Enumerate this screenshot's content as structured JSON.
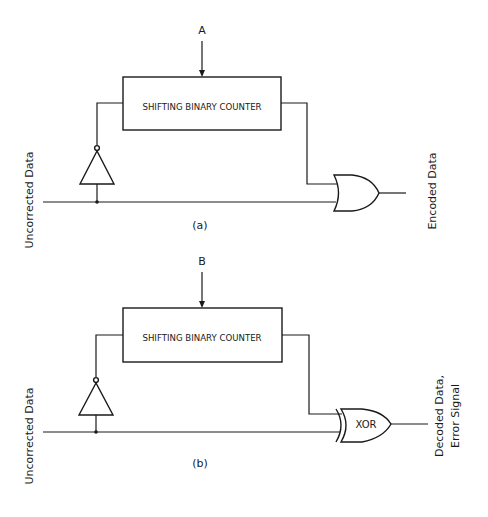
{
  "diagram": {
    "panels": [
      {
        "id": "a",
        "caption": "(a)",
        "control_input": "A",
        "block_label": "SHIFTING BINARY COUNTER",
        "input_label": "Uncorrected Data",
        "gate": "OR",
        "gate_label": "",
        "output_label_line1": "Encoded Data",
        "output_label_line2": ""
      },
      {
        "id": "b",
        "caption": "(b)",
        "control_input": "B",
        "block_label": "SHIFTING BINARY COUNTER",
        "input_label": "Uncorrected Data",
        "gate": "XOR",
        "gate_label": "XOR",
        "output_label_line1": "Decoded Data,",
        "output_label_line2": "Error Signal"
      }
    ],
    "colors": {
      "ink": "#1a1a1a",
      "background": "#ffffff"
    }
  }
}
